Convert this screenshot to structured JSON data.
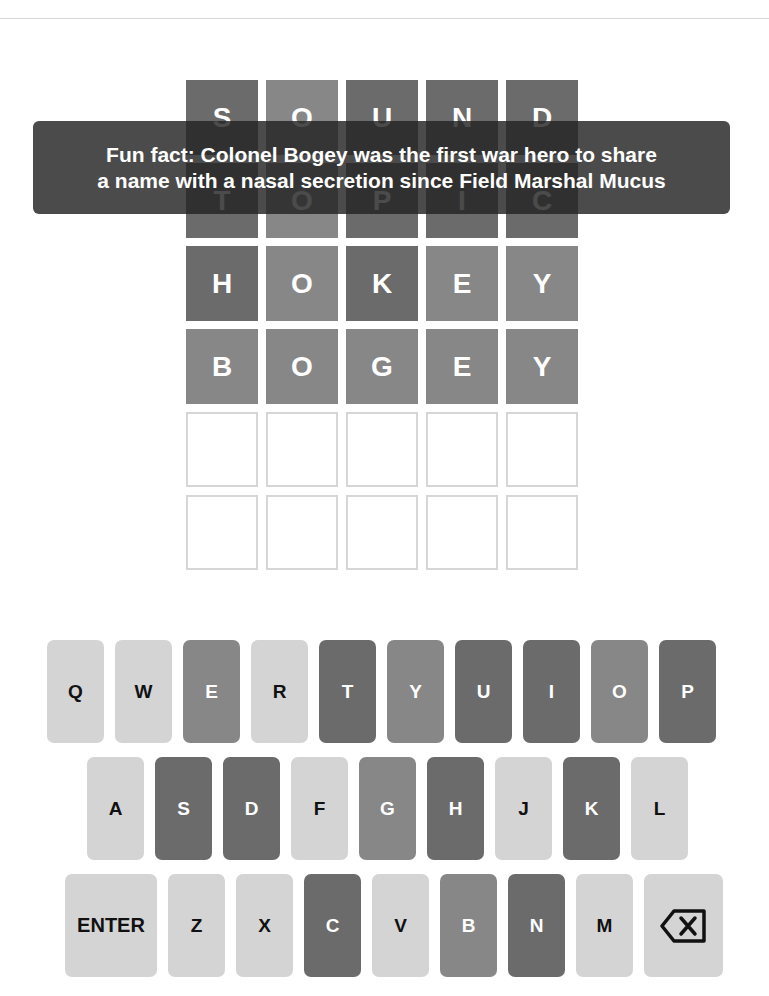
{
  "colors": {
    "correct": "#878787",
    "absent": "#6b6b6b",
    "unused": "#d4d4d4",
    "empty_border": "#d6d6d6",
    "toast_bg": "#232323"
  },
  "toast": {
    "line1": "Fun fact: Colonel Bogey was the first war hero to share",
    "line2": "a name with a nasal secretion since Field Marshal Mucus"
  },
  "board": {
    "rows": [
      {
        "letters": [
          "S",
          "O",
          "U",
          "N",
          "D"
        ],
        "states": [
          "absent",
          "correct",
          "absent",
          "absent",
          "absent"
        ]
      },
      {
        "letters": [
          "T",
          "O",
          "P",
          "I",
          "C"
        ],
        "states": [
          "absent",
          "correct",
          "absent",
          "absent",
          "absent"
        ]
      },
      {
        "letters": [
          "H",
          "O",
          "K",
          "E",
          "Y"
        ],
        "states": [
          "absent",
          "correct",
          "absent",
          "correct",
          "correct"
        ]
      },
      {
        "letters": [
          "B",
          "O",
          "G",
          "E",
          "Y"
        ],
        "states": [
          "correct",
          "correct",
          "correct",
          "correct",
          "correct"
        ]
      },
      {
        "letters": [
          "",
          "",
          "",
          "",
          ""
        ],
        "states": [
          "empty",
          "empty",
          "empty",
          "empty",
          "empty"
        ]
      },
      {
        "letters": [
          "",
          "",
          "",
          "",
          ""
        ],
        "states": [
          "empty",
          "empty",
          "empty",
          "empty",
          "empty"
        ]
      }
    ]
  },
  "keyboard": {
    "row1": [
      {
        "label": "Q",
        "state": "unused"
      },
      {
        "label": "W",
        "state": "unused"
      },
      {
        "label": "E",
        "state": "correct"
      },
      {
        "label": "R",
        "state": "unused"
      },
      {
        "label": "T",
        "state": "absent"
      },
      {
        "label": "Y",
        "state": "correct"
      },
      {
        "label": "U",
        "state": "absent"
      },
      {
        "label": "I",
        "state": "absent"
      },
      {
        "label": "O",
        "state": "correct"
      },
      {
        "label": "P",
        "state": "absent"
      }
    ],
    "row2": [
      {
        "label": "A",
        "state": "unused"
      },
      {
        "label": "S",
        "state": "absent"
      },
      {
        "label": "D",
        "state": "absent"
      },
      {
        "label": "F",
        "state": "unused"
      },
      {
        "label": "G",
        "state": "correct"
      },
      {
        "label": "H",
        "state": "absent"
      },
      {
        "label": "J",
        "state": "unused"
      },
      {
        "label": "K",
        "state": "absent"
      },
      {
        "label": "L",
        "state": "unused"
      }
    ],
    "row3": [
      {
        "label": "ENTER",
        "state": "unused"
      },
      {
        "label": "Z",
        "state": "unused"
      },
      {
        "label": "X",
        "state": "unused"
      },
      {
        "label": "C",
        "state": "absent"
      },
      {
        "label": "V",
        "state": "unused"
      },
      {
        "label": "B",
        "state": "correct"
      },
      {
        "label": "N",
        "state": "absent"
      },
      {
        "label": "M",
        "state": "unused"
      },
      {
        "label": "",
        "state": "unused",
        "icon": "backspace-icon"
      }
    ]
  }
}
